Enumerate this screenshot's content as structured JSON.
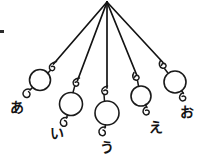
{
  "figure": {
    "background_color": "#ffffff",
    "ink_color": "#1a1a1a",
    "width": 199,
    "height": 157,
    "pivot": {
      "x": 107,
      "y": 2,
      "label": "common-suspension-point"
    },
    "pendulums": [
      {
        "id": "a",
        "label": "あ",
        "label_x": 10,
        "label_y": 100,
        "string_start": {
          "x": 107,
          "y": 2
        },
        "hook": {
          "x": 53,
          "y": 65
        },
        "bob": {
          "cx": 40,
          "cy": 80,
          "r": 10.5
        },
        "tail": {
          "x": 27,
          "y": 93
        },
        "string_length_rank": 2
      },
      {
        "id": "i",
        "label": "い",
        "label_x": 50,
        "label_y": 126,
        "string_start": {
          "x": 107,
          "y": 2
        },
        "hook": {
          "x": 77,
          "y": 82
        },
        "bob": {
          "cx": 71,
          "cy": 104,
          "r": 11.5
        },
        "tail": {
          "x": 66,
          "y": 119
        },
        "string_length_rank": 4
      },
      {
        "id": "u",
        "label": "う",
        "label_x": 100,
        "label_y": 140,
        "string_start": {
          "x": 107,
          "y": 2
        },
        "hook": {
          "x": 107,
          "y": 90
        },
        "bob": {
          "cx": 107,
          "cy": 113,
          "r": 12
        },
        "tail": {
          "x": 107,
          "y": 129
        },
        "string_length_rank": 5
      },
      {
        "id": "e",
        "label": "え",
        "label_x": 149,
        "label_y": 120,
        "string_start": {
          "x": 107,
          "y": 2
        },
        "hook": {
          "x": 137,
          "y": 76
        },
        "bob": {
          "cx": 141,
          "cy": 96,
          "r": 10
        },
        "tail": {
          "x": 148,
          "y": 111
        },
        "string_length_rank": 3
      },
      {
        "id": "o",
        "label": "お",
        "label_x": 180,
        "label_y": 105,
        "string_start": {
          "x": 107,
          "y": 2
        },
        "hook": {
          "x": 164,
          "y": 64
        },
        "bob": {
          "cx": 175,
          "cy": 82,
          "r": 11
        },
        "tail": {
          "x": 185,
          "y": 97
        },
        "string_length_rank": 1
      }
    ],
    "edge_artifact": {
      "x": 0,
      "y": 30,
      "width": 4,
      "height": 3
    }
  }
}
